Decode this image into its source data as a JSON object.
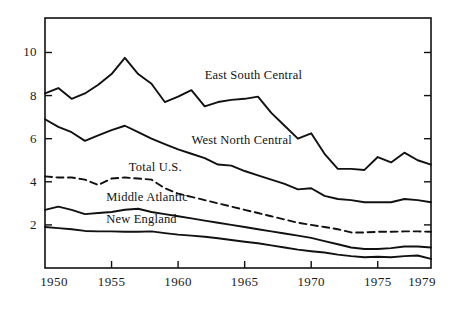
{
  "chart_data": {
    "type": "line",
    "title": "",
    "subtitle": "",
    "xlabel": "",
    "ylabel": "",
    "xlim": [
      1950,
      1979
    ],
    "ylim": [
      0,
      11.6
    ],
    "grid": false,
    "legend": "inline-labels",
    "x": [
      1950,
      1951,
      1952,
      1953,
      1954,
      1955,
      1956,
      1957,
      1958,
      1959,
      1960,
      1961,
      1962,
      1963,
      1964,
      1965,
      1966,
      1967,
      1968,
      1969,
      1970,
      1971,
      1972,
      1973,
      1974,
      1975,
      1976,
      1977,
      1978,
      1979
    ],
    "x_ticks": [
      1950,
      1955,
      1960,
      1965,
      1970,
      1975,
      1979
    ],
    "x_tick_labels": [
      "1950",
      "1955",
      "1960",
      "1965",
      "1970",
      "1975",
      "1979"
    ],
    "y_ticks": [
      2,
      4,
      6,
      8,
      10
    ],
    "y_tick_labels": [
      "2",
      "4",
      "6",
      "8",
      "10"
    ],
    "series": [
      {
        "name": "East South Central",
        "style": "solid",
        "color": "#111111",
        "label_x": 1962.0,
        "label_y": 8.9,
        "values": [
          8.1,
          8.35,
          7.85,
          8.1,
          8.5,
          9.0,
          9.75,
          9.0,
          8.55,
          7.7,
          7.95,
          8.25,
          7.5,
          7.7,
          7.8,
          7.85,
          7.95,
          7.2,
          6.6,
          6.0,
          6.25,
          5.3,
          4.6,
          4.6,
          4.55,
          5.15,
          4.9,
          5.35,
          5.0,
          4.8
        ]
      },
      {
        "name": "West North Central",
        "style": "solid",
        "color": "#111111",
        "label_x": 1961.0,
        "label_y": 5.9,
        "values": [
          6.9,
          6.55,
          6.3,
          5.9,
          6.15,
          6.4,
          6.6,
          6.3,
          6.0,
          5.75,
          5.5,
          5.3,
          5.1,
          4.8,
          4.75,
          4.5,
          4.3,
          4.1,
          3.9,
          3.65,
          3.7,
          3.35,
          3.2,
          3.15,
          3.05,
          3.05,
          3.05,
          3.2,
          3.15,
          3.05
        ]
      },
      {
        "name": "Total U.S.",
        "style": "dashed",
        "color": "#111111",
        "label_x": 1956.3,
        "label_y": 4.65,
        "values": [
          4.25,
          4.2,
          4.2,
          4.1,
          3.85,
          4.15,
          4.2,
          4.15,
          4.1,
          3.7,
          3.45,
          3.3,
          3.15,
          3.0,
          2.85,
          2.7,
          2.55,
          2.4,
          2.25,
          2.1,
          2.0,
          1.9,
          1.8,
          1.65,
          1.65,
          1.68,
          1.68,
          1.7,
          1.7,
          1.68
        ]
      },
      {
        "name": "Middle Atlantic",
        "style": "solid",
        "color": "#111111",
        "label_x": 1954.6,
        "label_y": 3.25,
        "values": [
          2.7,
          2.85,
          2.7,
          2.5,
          2.55,
          2.6,
          2.7,
          2.75,
          2.6,
          2.5,
          2.4,
          2.3,
          2.2,
          2.1,
          2.0,
          1.9,
          1.8,
          1.7,
          1.6,
          1.5,
          1.4,
          1.25,
          1.1,
          0.95,
          0.88,
          0.88,
          0.92,
          1.0,
          1.0,
          0.95
        ]
      },
      {
        "name": "New England",
        "style": "solid",
        "color": "#111111",
        "label_x": 1954.6,
        "label_y": 2.25,
        "values": [
          1.9,
          1.85,
          1.8,
          1.72,
          1.7,
          1.7,
          1.68,
          1.68,
          1.7,
          1.62,
          1.55,
          1.5,
          1.45,
          1.38,
          1.3,
          1.22,
          1.15,
          1.05,
          0.95,
          0.85,
          0.78,
          0.72,
          0.62,
          0.55,
          0.5,
          0.52,
          0.5,
          0.55,
          0.58,
          0.42
        ]
      }
    ]
  },
  "axes": {
    "frame": {
      "left": 45,
      "right": 431,
      "top": 18,
      "bottom": 268
    },
    "frame_color": "#111111"
  }
}
